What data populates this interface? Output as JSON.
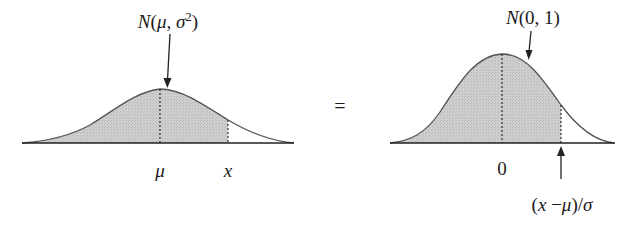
{
  "left_panel": {
    "title": "N(μ, σ²)",
    "title_parts": {
      "n": "N",
      "open": "(",
      "mu": "μ",
      "comma": ", ",
      "sigma": "σ",
      "sup": "2",
      "close": ")"
    },
    "mean_label": "μ",
    "x_label": "x",
    "fill_color": "#c9c9c9",
    "curve_color": "#555555"
  },
  "equals_sign": "=",
  "right_panel": {
    "title": "N(0, 1)",
    "title_parts": {
      "n": "N",
      "rest": "(0, 1)"
    },
    "mean_label": "0",
    "z_label": "(x − μ)/σ",
    "z_label_parts": {
      "open": "(",
      "x": "x",
      "minus": " −",
      "mu": "μ",
      "close": ")/",
      "sigma": "σ"
    },
    "fill_color": "#c9c9c9",
    "curve_color": "#555555"
  }
}
